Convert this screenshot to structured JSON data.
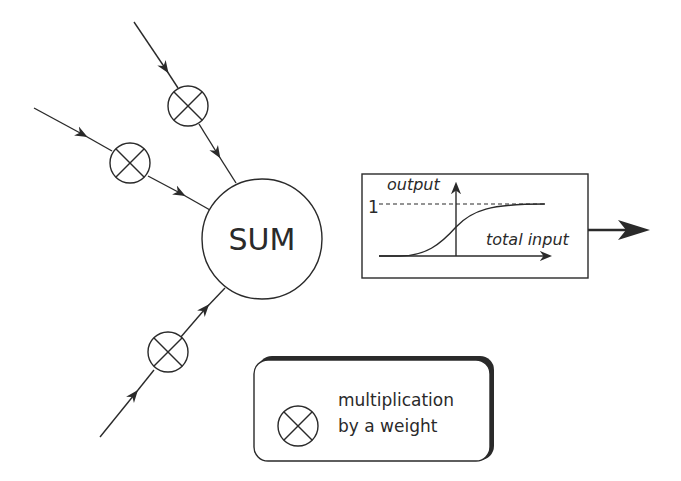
{
  "diagram": {
    "sum_node": {
      "label": "SUM"
    },
    "activation": {
      "y_axis_label": "output",
      "x_axis_label": "total input",
      "level_label": "1"
    },
    "legend": {
      "symbol": "multiply-circle-icon",
      "line1": "multiplication",
      "line2": "by a weight"
    },
    "colors": {
      "stroke": "#2a2a2a",
      "background": "#ffffff"
    }
  }
}
